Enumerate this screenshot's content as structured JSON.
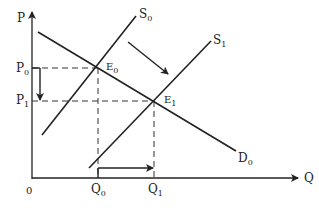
{
  "diagram": {
    "type": "supply-demand",
    "axes": {
      "y_label": "P",
      "x_label": "Q",
      "origin_label": "0"
    },
    "curves": [
      {
        "id": "D0",
        "label": "D",
        "sub": "0"
      },
      {
        "id": "S0",
        "label": "S",
        "sub": "0"
      },
      {
        "id": "S1",
        "label": "S",
        "sub": "1"
      }
    ],
    "points": [
      {
        "id": "E0",
        "label": "E",
        "sub": "0"
      },
      {
        "id": "E1",
        "label": "E",
        "sub": "1"
      }
    ],
    "price_labels": [
      {
        "label": "P",
        "sub": "0"
      },
      {
        "label": "P",
        "sub": "1"
      }
    ],
    "quantity_labels": [
      {
        "label": "Q",
        "sub": "0"
      },
      {
        "label": "Q",
        "sub": "1"
      }
    ],
    "colors": {
      "line": "#222222",
      "background": "#ffffff"
    }
  }
}
